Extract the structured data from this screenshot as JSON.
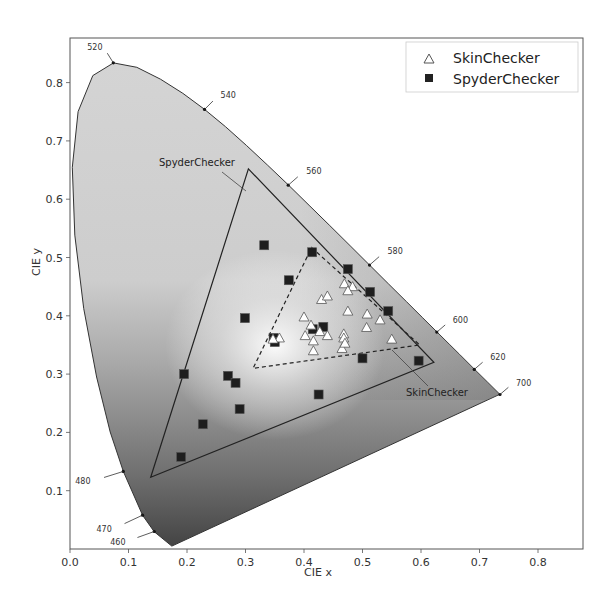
{
  "chart_data": {
    "type": "scatter",
    "title": "",
    "xlabel": "CIE x",
    "ylabel": "CIE y",
    "xlim": [
      0.0,
      0.875
    ],
    "ylim": [
      0.0,
      0.876
    ],
    "grid": false,
    "legend_position": "upper right",
    "x_ticks": [
      "0.0",
      "0.1",
      "0.2",
      "0.3",
      "0.4",
      "0.5",
      "0.6",
      "0.7",
      "0.8"
    ],
    "y_ticks": [
      "0.1",
      "0.2",
      "0.3",
      "0.4",
      "0.5",
      "0.6",
      "0.7",
      "0.8"
    ],
    "legend": [
      {
        "label": "SkinChecker",
        "marker": "open-triangle"
      },
      {
        "label": "SpyderChecker",
        "marker": "filled-square"
      }
    ],
    "spectral_locus_labels": [
      {
        "wavelength": "460",
        "x": 0.144,
        "y": 0.03
      },
      {
        "wavelength": "470",
        "x": 0.124,
        "y": 0.058
      },
      {
        "wavelength": "480",
        "x": 0.091,
        "y": 0.133
      },
      {
        "wavelength": "520",
        "x": 0.074,
        "y": 0.834
      },
      {
        "wavelength": "540",
        "x": 0.23,
        "y": 0.754
      },
      {
        "wavelength": "560",
        "x": 0.373,
        "y": 0.624
      },
      {
        "wavelength": "580",
        "x": 0.512,
        "y": 0.487
      },
      {
        "wavelength": "600",
        "x": 0.627,
        "y": 0.372
      },
      {
        "wavelength": "620",
        "x": 0.691,
        "y": 0.308
      },
      {
        "wavelength": "700",
        "x": 0.735,
        "y": 0.265
      }
    ],
    "spyder_gamut": [
      [
        0.305,
        0.652
      ],
      [
        0.622,
        0.32
      ],
      [
        0.138,
        0.123
      ]
    ],
    "skin_gamut": [
      [
        0.413,
        0.517
      ],
      [
        0.598,
        0.35
      ],
      [
        0.313,
        0.31
      ]
    ],
    "annotations": [
      {
        "text": "SpyderChecker",
        "x": 0.155,
        "y": 0.665
      },
      {
        "text": "SkinChecker",
        "x": 0.505,
        "y": 0.26
      }
    ],
    "series": [
      {
        "name": "SpyderChecker",
        "points": [
          [
            0.332,
            0.521
          ],
          [
            0.414,
            0.509
          ],
          [
            0.374,
            0.461
          ],
          [
            0.299,
            0.396
          ],
          [
            0.475,
            0.48
          ],
          [
            0.513,
            0.441
          ],
          [
            0.544,
            0.408
          ],
          [
            0.433,
            0.381
          ],
          [
            0.415,
            0.377
          ],
          [
            0.348,
            0.362
          ],
          [
            0.35,
            0.355
          ],
          [
            0.195,
            0.3
          ],
          [
            0.27,
            0.297
          ],
          [
            0.283,
            0.285
          ],
          [
            0.29,
            0.24
          ],
          [
            0.227,
            0.214
          ],
          [
            0.19,
            0.158
          ],
          [
            0.425,
            0.265
          ],
          [
            0.5,
            0.327
          ],
          [
            0.596,
            0.323
          ]
        ]
      },
      {
        "name": "SkinChecker",
        "points": [
          [
            0.469,
            0.455
          ],
          [
            0.483,
            0.45
          ],
          [
            0.475,
            0.443
          ],
          [
            0.43,
            0.428
          ],
          [
            0.44,
            0.434
          ],
          [
            0.475,
            0.408
          ],
          [
            0.508,
            0.403
          ],
          [
            0.53,
            0.393
          ],
          [
            0.4,
            0.398
          ],
          [
            0.412,
            0.384
          ],
          [
            0.507,
            0.38
          ],
          [
            0.402,
            0.366
          ],
          [
            0.416,
            0.357
          ],
          [
            0.44,
            0.366
          ],
          [
            0.468,
            0.369
          ],
          [
            0.468,
            0.362
          ],
          [
            0.55,
            0.36
          ],
          [
            0.416,
            0.34
          ],
          [
            0.465,
            0.344
          ],
          [
            0.358,
            0.362
          ],
          [
            0.347,
            0.36
          ],
          [
            0.47,
            0.353
          ],
          [
            0.427,
            0.373
          ]
        ]
      }
    ]
  }
}
